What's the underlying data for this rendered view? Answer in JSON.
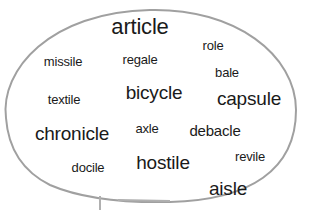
{
  "speech_bubble": {
    "stroke_color": "#a0a0a0",
    "text_color": "#1a1a1a",
    "words": [
      {
        "id": "article",
        "text": "article"
      },
      {
        "id": "missile",
        "text": "missile"
      },
      {
        "id": "regale",
        "text": "regale"
      },
      {
        "id": "role",
        "text": "role"
      },
      {
        "id": "bale",
        "text": "bale"
      },
      {
        "id": "textile",
        "text": "textile"
      },
      {
        "id": "bicycle",
        "text": "bicycle"
      },
      {
        "id": "capsule",
        "text": "capsule"
      },
      {
        "id": "chronicle",
        "text": "chronicle"
      },
      {
        "id": "axle",
        "text": "axle"
      },
      {
        "id": "debacle",
        "text": "debacle"
      },
      {
        "id": "revile",
        "text": "revile"
      },
      {
        "id": "docile",
        "text": "docile"
      },
      {
        "id": "hostile",
        "text": "hostile"
      },
      {
        "id": "aisle",
        "text": "aisle"
      }
    ]
  }
}
